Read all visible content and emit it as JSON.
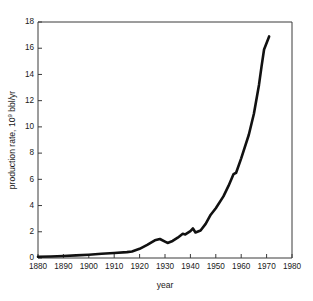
{
  "chart_data": {
    "type": "line",
    "title": "",
    "xlabel": "year",
    "ylabel": "production rate, 10⁹ bbl/yr",
    "ylabel_prefix": "production rate, 10",
    "ylabel_exponent": "9",
    "ylabel_suffix": " bbl/yr",
    "xlim": [
      1880,
      1980
    ],
    "ylim": [
      0,
      18
    ],
    "xticks": [
      1880,
      1890,
      1900,
      1910,
      1920,
      1930,
      1940,
      1950,
      1960,
      1970,
      1980
    ],
    "yticks": [
      0,
      2,
      4,
      6,
      8,
      10,
      12,
      14,
      16,
      18
    ],
    "xtick_labels": [
      "1880",
      "1890",
      "1900",
      "1910",
      "1920",
      "1930",
      "1940",
      "1950",
      "1960",
      "1970",
      "1980"
    ],
    "ytick_labels": [
      "0",
      "2",
      "4",
      "6",
      "8",
      "10",
      "12",
      "14",
      "16",
      "18"
    ],
    "grid": false,
    "legend": false,
    "line_color": "#111111",
    "axis_color": "#3a3a3a",
    "background_color": "#ffffff",
    "series": [
      {
        "name": "world crude oil production rate",
        "x": [
          1880,
          1885,
          1890,
          1895,
          1900,
          1905,
          1910,
          1915,
          1917,
          1920,
          1923,
          1926,
          1928,
          1930,
          1931,
          1933,
          1935,
          1937,
          1938,
          1940,
          1941,
          1942,
          1944,
          1946,
          1948,
          1950,
          1953,
          1955,
          1957,
          1958,
          1960,
          1963,
          1965,
          1967,
          1968,
          1969,
          1971
        ],
        "y": [
          0.1,
          0.12,
          0.15,
          0.2,
          0.25,
          0.32,
          0.38,
          0.45,
          0.5,
          0.7,
          1.0,
          1.35,
          1.45,
          1.25,
          1.15,
          1.3,
          1.55,
          1.85,
          1.8,
          2.05,
          2.25,
          1.95,
          2.1,
          2.6,
          3.3,
          3.8,
          4.7,
          5.5,
          6.4,
          6.5,
          7.6,
          9.4,
          11.0,
          13.2,
          14.6,
          15.9,
          16.9
        ]
      }
    ]
  },
  "geometry": {
    "plot_left": 38,
    "plot_right": 292,
    "plot_top": 22,
    "plot_bottom": 258
  }
}
